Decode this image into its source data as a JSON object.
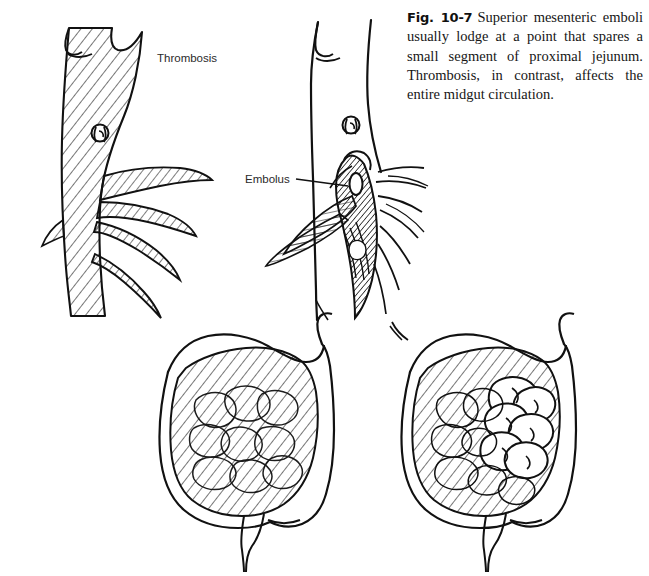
{
  "figure": {
    "number": "Fig. 10-7",
    "caption": "Superior mesenteric emboli usually lodge at a point that spares a small segment of proximal jejunum. Thrombosis, in contrast, affects the entire midgut circulation.",
    "background_color": "#ffffff",
    "ink_color": "#111111"
  },
  "labels": {
    "thrombosis": "Thrombosis",
    "embolus": "Embolus"
  },
  "panels": [
    {
      "id": "top-left",
      "name": "thrombosis-vessel-diagram",
      "description": "Superior mesenteric artery and branches fully hatched indicating thrombosis affecting entire midgut circulation",
      "label": "Thrombosis",
      "occlusion_type": "thrombosis",
      "vessel_shading": "hatched-throughout"
    },
    {
      "id": "top-right",
      "name": "embolus-vessel-diagram",
      "description": "Superior mesenteric artery open proximally with dark embolus lodged distally sparing proximal jejunal branches",
      "label": "Embolus",
      "occlusion_type": "embolus",
      "vessel_shading": "open-proximal-dark-distal"
    },
    {
      "id": "bottom-left",
      "name": "thrombosis-bowel-diagram",
      "description": "Entire midgut bowel hatched indicating complete ischemia",
      "spared_segment": false
    },
    {
      "id": "bottom-right",
      "name": "embolus-bowel-diagram",
      "description": "Bowel hatched except for spared proximal jejunal loops shown unshaded",
      "spared_segment": true
    }
  ]
}
